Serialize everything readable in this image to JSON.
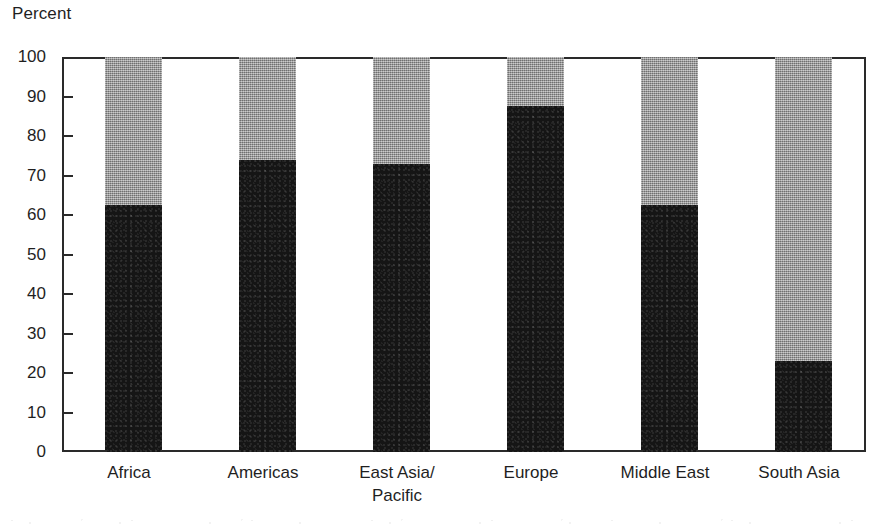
{
  "chart_data": {
    "type": "bar",
    "subtype": "stacked-100-percent",
    "title": "",
    "xlabel": "",
    "ylabel": "Percent",
    "ylim": [
      0,
      100
    ],
    "ytick_step": 10,
    "yticks": [
      100,
      90,
      80,
      70,
      60,
      50,
      40,
      30,
      20,
      10,
      0
    ],
    "grid": false,
    "legend": "none",
    "categories": [
      "Africa",
      "Americas",
      "East Asia/ Pacific",
      "Europe",
      "Middle East",
      "South Asia"
    ],
    "category_lines": [
      [
        "Africa"
      ],
      [
        "Americas"
      ],
      [
        "East Asia/",
        "Pacific"
      ],
      [
        "Europe"
      ],
      [
        "Middle East"
      ],
      [
        "South Asia"
      ]
    ],
    "series": [
      {
        "name": "dark-segment",
        "color": "#151515",
        "fill": "dark-noise",
        "values": [
          62.5,
          74,
          73,
          87.5,
          62.5,
          23
        ]
      },
      {
        "name": "gray-segment",
        "color": "#9b9b9b",
        "fill": "gray-halftone",
        "values": [
          37.5,
          26,
          27,
          12.5,
          37.5,
          77
        ]
      }
    ]
  },
  "axis": {
    "y_title": "Percent"
  },
  "colors": {
    "dark": "#151515",
    "gray": "#9b9b9b",
    "frame": "#2a2a2a",
    "background": "#ffffff",
    "text": "#1f1f1f"
  }
}
